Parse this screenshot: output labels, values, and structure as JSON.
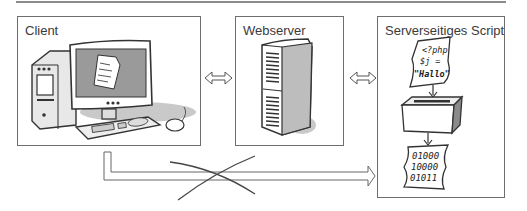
{
  "diagram": {
    "boxes": [
      {
        "id": "client",
        "label": "Client"
      },
      {
        "id": "webserver",
        "label": "Webserver"
      },
      {
        "id": "script",
        "label": "Serverseitiges Script"
      }
    ],
    "script_source": {
      "line1": "<?php",
      "line2": "$j =",
      "line3": "\"Hallo\""
    },
    "binary_output": {
      "line1": "01000",
      "line2": "10000",
      "line3": "01011"
    },
    "connections": [
      {
        "from": "client",
        "to": "webserver",
        "type": "bidirectional"
      },
      {
        "from": "webserver",
        "to": "script",
        "type": "bidirectional"
      },
      {
        "from": "client",
        "to": "script",
        "type": "direct",
        "crossed_out": true
      }
    ],
    "colors": {
      "line": "#6e6e6e",
      "shade": "#b8b8b8",
      "text": "#3a3a3a"
    }
  }
}
